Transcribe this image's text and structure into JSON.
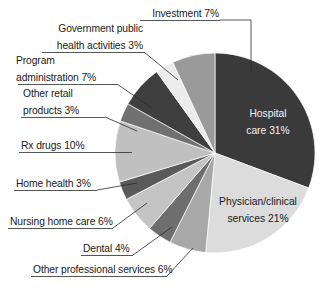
{
  "chart_data": {
    "type": "pie",
    "title": "",
    "subtitle": "",
    "xlabel": "",
    "ylabel": "",
    "legend_position": "none",
    "grid": false,
    "start_angle_deg": 0,
    "direction": "clockwise",
    "categories": [
      "Hospital care",
      "Physician/clinical services",
      "Other professional services",
      "Dental",
      "Nursing home care",
      "Home health",
      "Rx drugs",
      "Other retail products",
      "Program administration",
      "Government public health activities",
      "Investment"
    ],
    "values": [
      31,
      21,
      6,
      4,
      6,
      3,
      10,
      3,
      7,
      3,
      7
    ],
    "value_suffix": "%",
    "colors": [
      "#3a3a3a",
      "#dcdcdc",
      "#a8a8a8",
      "#6e6e6e",
      "#c4c4c4",
      "#5a5a5a",
      "#c0c0c0",
      "#707070",
      "#3f3f3f",
      "#ececec",
      "#9a9a9a"
    ],
    "slices": [
      {
        "label": "Hospital care",
        "value": 31,
        "color": "#3a3a3a",
        "label_text": "Hospital care 31%",
        "placement": "inside",
        "text_color": "#f2f2f2"
      },
      {
        "label": "Physician/clinical services",
        "value": 21,
        "color": "#dcdcdc",
        "label_text": "Physician/clinical services 21%",
        "placement": "inside",
        "text_color": "#1a1a1a"
      },
      {
        "label": "Other professional services",
        "value": 6,
        "color": "#a8a8a8",
        "label_text": "Other professional services 6%",
        "placement": "outside",
        "text_color": "#1a1a1a"
      },
      {
        "label": "Dental",
        "value": 4,
        "color": "#6e6e6e",
        "label_text": "Dental 4%",
        "placement": "outside",
        "text_color": "#1a1a1a"
      },
      {
        "label": "Nursing home care",
        "value": 6,
        "color": "#c4c4c4",
        "label_text": "Nursing home care 6%",
        "placement": "outside",
        "text_color": "#1a1a1a"
      },
      {
        "label": "Home health",
        "value": 3,
        "color": "#5a5a5a",
        "label_text": "Home health 3%",
        "placement": "outside",
        "text_color": "#1a1a1a"
      },
      {
        "label": "Rx drugs",
        "value": 10,
        "color": "#c0c0c0",
        "label_text": "Rx drugs 10%",
        "placement": "outside",
        "text_color": "#1a1a1a"
      },
      {
        "label": "Other retail products",
        "value": 3,
        "color": "#707070",
        "label_text": "Other retail products 3%",
        "placement": "outside",
        "text_color": "#1a1a1a"
      },
      {
        "label": "Program administration",
        "value": 7,
        "color": "#3f3f3f",
        "label_text": "Program administration 7%",
        "placement": "outside",
        "text_color": "#1a1a1a"
      },
      {
        "label": "Government public health activities",
        "value": 3,
        "color": "#ececec",
        "label_text": "Government public health activities 3%",
        "placement": "outside",
        "text_color": "#1a1a1a"
      },
      {
        "label": "Investment",
        "value": 7,
        "color": "#9a9a9a",
        "label_text": "Investment 7%",
        "placement": "outside",
        "text_color": "#1a1a1a"
      }
    ]
  },
  "labels": {
    "investment": {
      "line1": "Investment 7%"
    },
    "government_public_health": {
      "line1": "Government public",
      "line2": "health activities 3%"
    },
    "program_administration": {
      "line1": "Program",
      "line2": "administration 7%"
    },
    "other_retail_products": {
      "line1": "Other retail",
      "line2": "products 3%"
    },
    "rx_drugs": {
      "line1": "Rx drugs 10%"
    },
    "home_health": {
      "line1": "Home health 3%"
    },
    "nursing_home_care": {
      "line1": "Nursing home care 6%"
    },
    "dental": {
      "line1": "Dental 4%"
    },
    "other_professional_services": {
      "line1": "Other professional services 6%"
    },
    "hospital_care": {
      "line1": "Hospital",
      "line2": "care 31%"
    },
    "physician_clinical": {
      "line1": "Physician/clinical",
      "line2": "services 21%"
    }
  },
  "geometry": {
    "center_x": 215,
    "center_y": 153,
    "radius": 100
  }
}
